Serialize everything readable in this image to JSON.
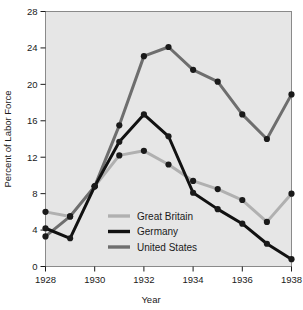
{
  "figure": {
    "background_color": "#ffffff",
    "plot_background_color": "#e6e6e6",
    "plot_border_color": "#8a8a8a"
  },
  "chart_data": {
    "type": "line",
    "title": "",
    "xlabel": "Year",
    "ylabel": "Percent of Labor Force",
    "x": [
      1928,
      1929,
      1930,
      1931,
      1932,
      1933,
      1934,
      1935,
      1936,
      1937,
      1938
    ],
    "xlim": [
      1928,
      1938
    ],
    "ylim": [
      0,
      28
    ],
    "xticks": [
      1928,
      1930,
      1932,
      1934,
      1936,
      1938
    ],
    "xtick_labels": [
      "1928",
      "1930",
      "1932",
      "1934",
      "1936",
      "1938"
    ],
    "yticks": [
      0,
      4,
      8,
      12,
      16,
      20,
      24,
      28
    ],
    "ytick_labels": [
      "0",
      "4",
      "8",
      "12",
      "16",
      "20",
      "24",
      "28"
    ],
    "grid": false,
    "legend_position": "lower-left-inside",
    "marker": "filled-circle",
    "marker_color": "#1a1a1a",
    "series": [
      {
        "name": "Great Britain",
        "color": "#b0b0b0",
        "line_width": 3,
        "values": [
          6.0,
          5.5,
          8.8,
          12.2,
          12.7,
          11.2,
          9.4,
          8.5,
          7.3,
          4.9,
          8.0
        ]
      },
      {
        "name": "Germany",
        "color": "#111111",
        "line_width": 3,
        "values": [
          4.2,
          3.1,
          8.8,
          13.7,
          16.7,
          14.3,
          8.1,
          6.3,
          4.7,
          2.5,
          0.8
        ]
      },
      {
        "name": "United States",
        "color": "#6e6e6e",
        "line_width": 3,
        "values": [
          3.3,
          5.5,
          8.8,
          15.5,
          23.1,
          24.1,
          21.6,
          20.3,
          16.7,
          14.0,
          18.9
        ]
      }
    ]
  },
  "legend": {
    "entries": [
      {
        "label": "Great Britain",
        "color": "#b0b0b0"
      },
      {
        "label": "Germany",
        "color": "#111111"
      },
      {
        "label": "United States",
        "color": "#6e6e6e"
      }
    ]
  }
}
